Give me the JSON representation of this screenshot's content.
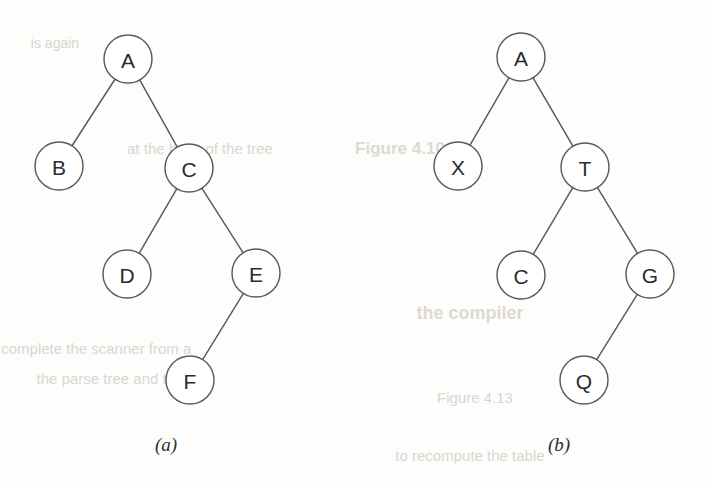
{
  "figure": {
    "background_color": "#fdfdfc",
    "stroke_color": "#5a5a5a",
    "label_color": "#2b2b2b",
    "node_radius": 24
  },
  "trees": [
    {
      "id": "tree-a",
      "caption": "(a)",
      "caption_x": 166,
      "caption_y": 444,
      "nodes": [
        {
          "id": "a-A",
          "label": "A",
          "cx": 128,
          "cy": 59
        },
        {
          "id": "a-B",
          "label": "B",
          "cx": 59,
          "cy": 166
        },
        {
          "id": "a-C",
          "label": "C",
          "cx": 189,
          "cy": 168
        },
        {
          "id": "a-D",
          "label": "D",
          "cx": 127,
          "cy": 274
        },
        {
          "id": "a-E",
          "label": "E",
          "cx": 256,
          "cy": 273
        },
        {
          "id": "a-F",
          "label": "F",
          "cx": 190,
          "cy": 380
        }
      ],
      "edges": [
        {
          "from": "a-A",
          "to": "a-B"
        },
        {
          "from": "a-A",
          "to": "a-C"
        },
        {
          "from": "a-C",
          "to": "a-D"
        },
        {
          "from": "a-C",
          "to": "a-E"
        },
        {
          "from": "a-E",
          "to": "a-F"
        }
      ]
    },
    {
      "id": "tree-b",
      "caption": "(b)",
      "caption_x": 559,
      "caption_y": 444,
      "nodes": [
        {
          "id": "b-A",
          "label": "A",
          "cx": 521,
          "cy": 57
        },
        {
          "id": "b-X",
          "label": "X",
          "cx": 458,
          "cy": 166
        },
        {
          "id": "b-T",
          "label": "T",
          "cx": 585,
          "cy": 167
        },
        {
          "id": "b-C",
          "label": "C",
          "cx": 521,
          "cy": 275
        },
        {
          "id": "b-G",
          "label": "G",
          "cx": 650,
          "cy": 274
        },
        {
          "id": "b-Q",
          "label": "Q",
          "cx": 584,
          "cy": 380
        }
      ],
      "edges": [
        {
          "from": "b-A",
          "to": "b-X"
        },
        {
          "from": "b-A",
          "to": "b-T"
        },
        {
          "from": "b-T",
          "to": "b-C"
        },
        {
          "from": "b-T",
          "to": "b-G"
        },
        {
          "from": "b-G",
          "to": "b-Q"
        }
      ]
    }
  ],
  "bleed_through": [
    {
      "text": "Figure 4.10",
      "x": 400,
      "y": 148,
      "size": 17,
      "bold": true
    },
    {
      "text": "at the base of the tree",
      "x": 200,
      "y": 148,
      "size": 15,
      "bold": false
    },
    {
      "text": "the compiler",
      "x": 470,
      "y": 313,
      "size": 18,
      "bold": true
    },
    {
      "text": "a complete the scanner from a",
      "x": 90,
      "y": 348,
      "size": 15,
      "bold": false
    },
    {
      "text": "the parse tree and the",
      "x": 110,
      "y": 378,
      "size": 15,
      "bold": false
    },
    {
      "text": "Figure 4.13",
      "x": 475,
      "y": 397,
      "size": 15,
      "bold": false
    },
    {
      "text": "to recompute the table",
      "x": 470,
      "y": 455,
      "size": 15,
      "bold": false
    },
    {
      "text": "is again",
      "x": 55,
      "y": 43,
      "size": 14,
      "bold": false
    }
  ]
}
